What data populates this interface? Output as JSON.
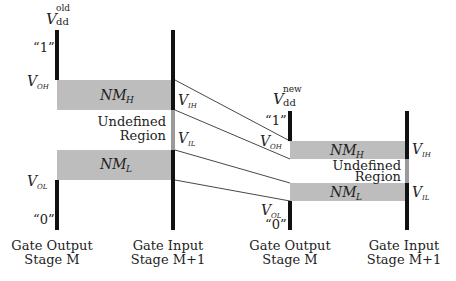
{
  "left_stage": {
    "vdd_label": "V",
    "vdd_sub": "dd",
    "vdd_sup": "old",
    "one_label": "“1”",
    "zero_label": "“0”",
    "voh_label": "V",
    "voh_sub": "OH",
    "vol_label": "V",
    "vol_sub": "OL",
    "vih_label": "V",
    "vih_sub": "IH",
    "vil_label": "V",
    "vil_sub": "IL",
    "nmh_label": "NM",
    "nmh_sub": "H",
    "nml_label": "NM",
    "nml_sub": "L",
    "undefined_line1": "Undefined",
    "undefined_line2": "Region",
    "output_caption_1": "Gate Output",
    "output_caption_2": "Stage M",
    "input_caption_1": "Gate Input",
    "input_caption_2": "Stage M+1"
  },
  "right_stage": {
    "vdd_label": "V",
    "vdd_sub": "dd",
    "vdd_sup": "new",
    "one_label": "“1”",
    "zero_label": "“0”",
    "voh_label": "V",
    "voh_sub": "OH",
    "vol_label": "V",
    "vol_sub": "OL",
    "vih_label": "V",
    "vih_sub": "IH",
    "vil_label": "V",
    "vil_sub": "IL",
    "nmh_label": "NM",
    "nmh_sub": "H",
    "nml_label": "NM",
    "nml_sub": "L",
    "undefined_line1": "Undefined",
    "undefined_line2": "Region",
    "output_caption_1": "Gate Output",
    "output_caption_2": "Stage M",
    "input_caption_1": "Gate Input",
    "input_caption_2": "Stage M+1"
  },
  "colors": {
    "bar": "#111111",
    "band": "#bdbdbd",
    "undefined_bar": "#9a9a9a",
    "connector": "#333333"
  }
}
